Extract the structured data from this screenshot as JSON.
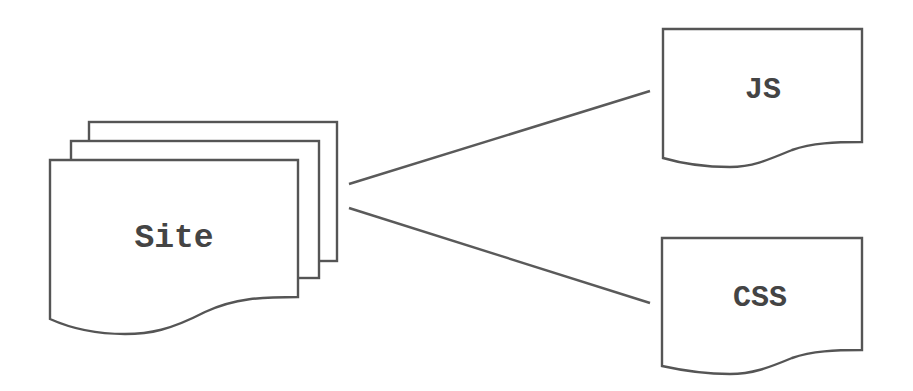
{
  "diagram": {
    "type": "flowchart",
    "colors": {
      "stroke": "#555555",
      "text": "#444444",
      "background": "#ffffff"
    },
    "nodes": [
      {
        "id": "site",
        "label": "Site",
        "shape": "multi-document"
      },
      {
        "id": "js",
        "label": "JS",
        "shape": "document"
      },
      {
        "id": "css",
        "label": "CSS",
        "shape": "document"
      }
    ],
    "edges": [
      {
        "from": "site",
        "to": "js"
      },
      {
        "from": "site",
        "to": "css"
      }
    ]
  }
}
